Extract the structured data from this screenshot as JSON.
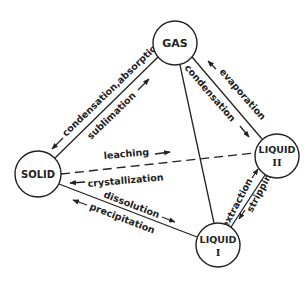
{
  "diagram": {
    "type": "phase-transfer-diagram",
    "colors": {
      "line": "#222222",
      "background": "#ffffff"
    },
    "nodes": {
      "gas": {
        "label": "GAS",
        "cx": 175,
        "cy": 43,
        "r": 22
      },
      "solid": {
        "label": "SOLID",
        "cx": 38,
        "cy": 174,
        "r": 23
      },
      "liquid2": {
        "label_top": "LIQUID",
        "label_bottom": "II",
        "cx": 277,
        "cy": 156,
        "r": 22
      },
      "liquid1": {
        "label_top": "LIQUID",
        "label_bottom": "I",
        "cx": 218,
        "cy": 245,
        "r": 22
      }
    },
    "edges": {
      "gas_solid": {
        "style": "solid",
        "label_outer": "condensation,absorption",
        "label_inner": "sublimation",
        "outer_arrow": "toward-solid",
        "inner_arrow": "toward-gas"
      },
      "gas_liquid2": {
        "style": "solid",
        "label_inner": "condensation",
        "label_outer": "evaporation",
        "inner_arrow": "toward-liquid2",
        "outer_arrow": "toward-gas"
      },
      "gas_liquid1": {
        "style": "solid"
      },
      "solid_liquid2": {
        "style": "dashed",
        "label_top": "leaching",
        "label_bottom": "crystallization",
        "top_arrow": "toward-liquid2",
        "bottom_arrow": "toward-solid"
      },
      "solid_liquid1": {
        "style": "solid",
        "label_top": "dissolution",
        "label_bottom": "precipitation",
        "top_arrow": "toward-liquid1",
        "bottom_arrow": "toward-solid"
      },
      "liquid1_liquid2": {
        "style": "solid",
        "label_left": "extraction",
        "label_right": "stripping",
        "left_arrow": "toward-liquid2",
        "right_arrow": "toward-liquid1"
      }
    }
  }
}
